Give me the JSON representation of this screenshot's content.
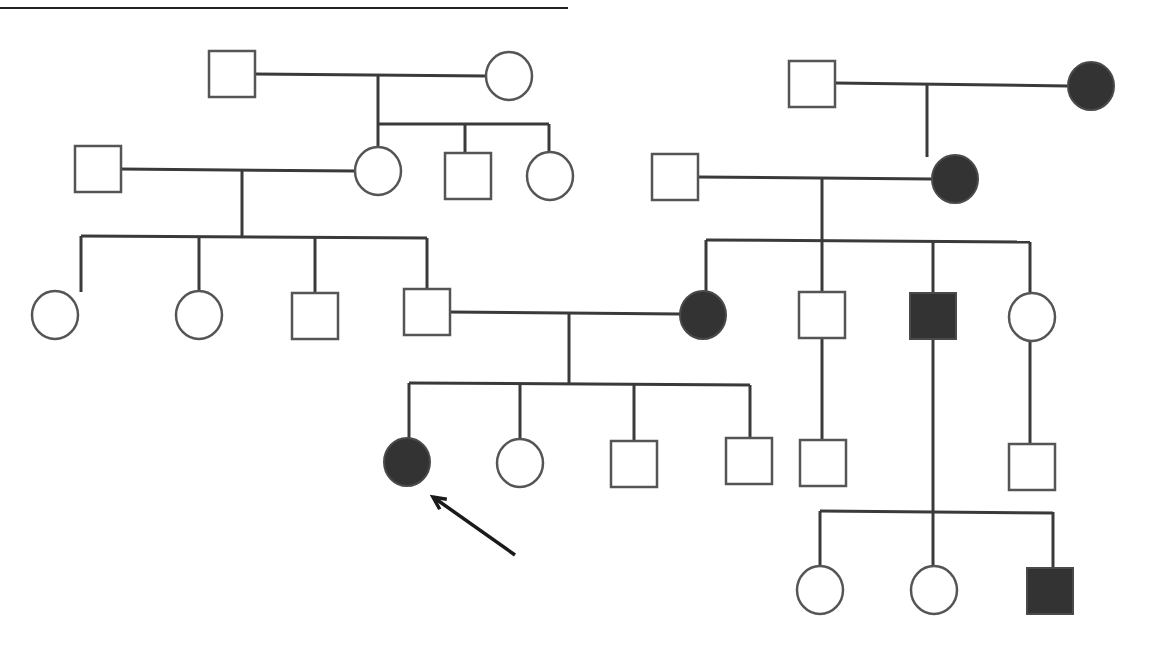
{
  "diagram": {
    "type": "pedigree",
    "colors": {
      "line": "#3a3a3a",
      "affected_fill": "#333333",
      "unaffected_fill": "#ffffff",
      "outline": "#555555"
    },
    "top_rule": {
      "x1": 0,
      "y1": 8,
      "x2": 568,
      "y2": 8
    },
    "individuals": [
      {
        "id": "I-1",
        "sex": "male",
        "affected": false,
        "cx": 232,
        "cy": 74
      },
      {
        "id": "I-2",
        "sex": "female",
        "affected": false,
        "cx": 509,
        "cy": 76
      },
      {
        "id": "I-3",
        "sex": "male",
        "affected": false,
        "cx": 812,
        "cy": 84
      },
      {
        "id": "I-4",
        "sex": "female",
        "affected": true,
        "cx": 1091,
        "cy": 86
      },
      {
        "id": "II-1",
        "sex": "male",
        "affected": false,
        "cx": 98,
        "cy": 169
      },
      {
        "id": "II-2",
        "sex": "female",
        "affected": false,
        "cx": 378,
        "cy": 171
      },
      {
        "id": "II-3",
        "sex": "male",
        "affected": false,
        "cx": 468,
        "cy": 176
      },
      {
        "id": "II-4",
        "sex": "female",
        "affected": false,
        "cx": 550,
        "cy": 176
      },
      {
        "id": "II-5",
        "sex": "male",
        "affected": false,
        "cx": 675,
        "cy": 177
      },
      {
        "id": "II-6",
        "sex": "female",
        "affected": true,
        "cx": 955,
        "cy": 179
      },
      {
        "id": "III-1",
        "sex": "female",
        "affected": false,
        "cx": 55,
        "cy": 315
      },
      {
        "id": "III-2",
        "sex": "female",
        "affected": false,
        "cx": 199,
        "cy": 315
      },
      {
        "id": "III-3",
        "sex": "male",
        "affected": false,
        "cx": 315,
        "cy": 316
      },
      {
        "id": "III-4",
        "sex": "male",
        "affected": false,
        "cx": 427,
        "cy": 312
      },
      {
        "id": "III-5",
        "sex": "female",
        "affected": true,
        "cx": 703,
        "cy": 315
      },
      {
        "id": "III-6",
        "sex": "male",
        "affected": false,
        "cx": 822,
        "cy": 315
      },
      {
        "id": "III-7",
        "sex": "male",
        "affected": true,
        "cx": 933,
        "cy": 316
      },
      {
        "id": "III-8",
        "sex": "female",
        "affected": false,
        "cx": 1032,
        "cy": 317
      },
      {
        "id": "IV-1",
        "sex": "female",
        "affected": true,
        "cx": 407,
        "cy": 462,
        "proband": true
      },
      {
        "id": "IV-2",
        "sex": "female",
        "affected": false,
        "cx": 520,
        "cy": 463
      },
      {
        "id": "IV-3",
        "sex": "male",
        "affected": false,
        "cx": 634,
        "cy": 464
      },
      {
        "id": "IV-4",
        "sex": "male",
        "affected": false,
        "cx": 749,
        "cy": 461
      },
      {
        "id": "IV-5",
        "sex": "male",
        "affected": false,
        "cx": 823,
        "cy": 463
      },
      {
        "id": "IV-6",
        "sex": "male",
        "affected": false,
        "cx": 1032,
        "cy": 467
      },
      {
        "id": "V-1",
        "sex": "female",
        "affected": false,
        "cx": 820,
        "cy": 590
      },
      {
        "id": "V-2",
        "sex": "female",
        "affected": false,
        "cx": 934,
        "cy": 590
      },
      {
        "id": "V-3",
        "sex": "male",
        "affected": true,
        "cx": 1050,
        "cy": 591
      }
    ],
    "lines": [
      [
        254,
        74,
        487,
        76
      ],
      [
        378,
        75,
        378,
        124
      ],
      [
        378,
        124,
        549,
        124
      ],
      [
        378,
        124,
        378,
        148
      ],
      [
        465,
        124,
        465,
        153
      ],
      [
        549,
        124,
        549,
        153
      ],
      [
        834,
        83,
        1068,
        86
      ],
      [
        927,
        84,
        927,
        157
      ],
      [
        120,
        169,
        356,
        171
      ],
      [
        242,
        170,
        242,
        236
      ],
      [
        81,
        236,
        427,
        238
      ],
      [
        81,
        236,
        81,
        292
      ],
      [
        199,
        236,
        199,
        292
      ],
      [
        315,
        237,
        315,
        293
      ],
      [
        427,
        238,
        427,
        289
      ],
      [
        698,
        177,
        932,
        179
      ],
      [
        822,
        178,
        822,
        240
      ],
      [
        706,
        240,
        1030,
        242
      ],
      [
        706,
        240,
        706,
        292
      ],
      [
        822,
        240,
        822,
        292
      ],
      [
        933,
        241,
        933,
        292
      ],
      [
        1030,
        242,
        1030,
        294
      ],
      [
        449,
        312,
        680,
        314
      ],
      [
        569,
        313,
        569,
        383
      ],
      [
        409,
        383,
        750,
        385
      ],
      [
        409,
        383,
        409,
        439
      ],
      [
        520,
        384,
        520,
        440
      ],
      [
        634,
        384,
        634,
        441
      ],
      [
        750,
        385,
        750,
        438
      ],
      [
        822,
        338,
        822,
        440
      ],
      [
        933,
        339,
        933,
        567
      ],
      [
        1030,
        340,
        1030,
        444
      ],
      [
        820,
        511,
        1053,
        513
      ],
      [
        820,
        511,
        820,
        566
      ],
      [
        1053,
        512,
        1053,
        567
      ]
    ],
    "proband_arrow": {
      "x1": 515,
      "y1": 555,
      "x2": 433,
      "y2": 497,
      "label": "proband"
    }
  }
}
